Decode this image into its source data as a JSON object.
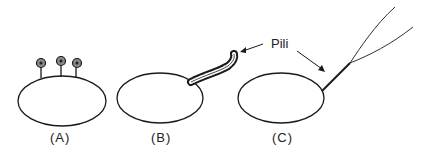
{
  "diagram": {
    "labels": {
      "pili": "Pili",
      "panel_a": "(A)",
      "panel_b": "(B)",
      "panel_c": "(C)"
    },
    "panels": [
      {
        "id": "A",
        "description": "cell with three short knobbed appendages on top"
      },
      {
        "id": "B",
        "description": "cell with thick beaded bundle of pili extending up-right"
      },
      {
        "id": "C",
        "description": "cell with thin pilus bundle splitting into two long filaments"
      }
    ],
    "stroke_color": "#1a1a1a"
  }
}
